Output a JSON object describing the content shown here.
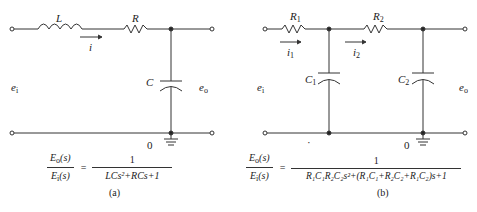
{
  "figure_a": {
    "labels": {
      "inductor": "L",
      "resistor": "R",
      "current": "i",
      "capacitor": "C",
      "input": "e",
      "input_sub": "i",
      "output": "e",
      "output_sub": "o",
      "ground": "0"
    },
    "transfer_function": {
      "numerator": "E",
      "numerator_sub": "o",
      "numerator_arg": "(s)",
      "denominator": "E",
      "denominator_sub": "i",
      "denominator_arg": "(s)",
      "equals": "=",
      "rhs_numerator": "1",
      "rhs_denominator": "LCs²+RCs+1"
    },
    "caption": "(a)"
  },
  "figure_b": {
    "labels": {
      "resistor1": "R",
      "resistor1_sub": "1",
      "resistor2": "R",
      "resistor2_sub": "2",
      "current1": "i",
      "current1_sub": "1",
      "current2": "i",
      "current2_sub": "2",
      "capacitor1": "C",
      "capacitor1_sub": "1",
      "capacitor2": "C",
      "capacitor2_sub": "2",
      "input": "e",
      "input_sub": "i",
      "output": "e",
      "output_sub": "o",
      "ground": "0",
      "dot": "·"
    },
    "transfer_function": {
      "numerator": "E",
      "numerator_sub": "o",
      "numerator_arg": "(s)",
      "denominator": "E",
      "denominator_sub": "i",
      "denominator_arg": "(s)",
      "equals": "=",
      "rhs_numerator": "1",
      "rhs_denominator": "R₁C₁R₂C₂s²+(R₁C₁+R₂C₂+R₁C₂)s+1"
    },
    "caption": "(b)"
  },
  "colors": {
    "line": "#333333",
    "background": "#ffffff"
  }
}
